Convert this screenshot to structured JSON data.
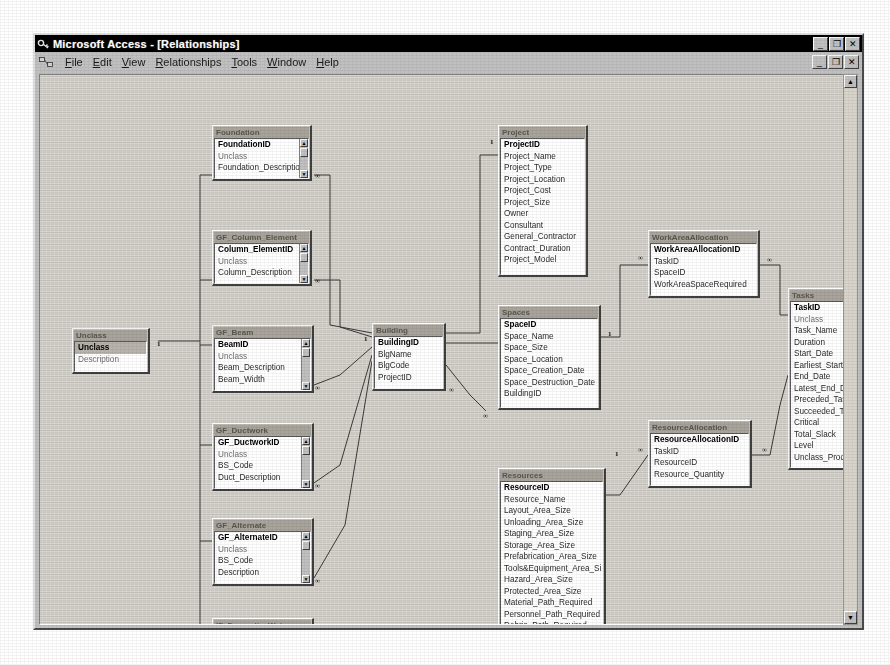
{
  "window": {
    "title": "Microsoft Access - [Relationships]",
    "app_icon": "access-key-icon",
    "buttons": {
      "minimize": "_",
      "restore": "❐",
      "close": "✕"
    },
    "mdi_buttons": {
      "minimize": "_",
      "restore": "❐",
      "close": "✕"
    }
  },
  "menubar": {
    "icon": "relationships-toolbar-icon",
    "items": [
      {
        "label": "File",
        "mnemonic": "F"
      },
      {
        "label": "Edit",
        "mnemonic": "E"
      },
      {
        "label": "View",
        "mnemonic": "V"
      },
      {
        "label": "Relationships",
        "mnemonic": "R"
      },
      {
        "label": "Tools",
        "mnemonic": "T"
      },
      {
        "label": "Window",
        "mnemonic": "W"
      },
      {
        "label": "Help",
        "mnemonic": "H"
      }
    ]
  },
  "scrollbar": {
    "up": "▲",
    "down": "▼"
  },
  "tables": [
    {
      "id": "foundation",
      "caption": "Foundation",
      "x": 172,
      "y": 50,
      "w": 100,
      "h": 56,
      "has_scroll": true,
      "fields": [
        {
          "name": "FoundationID",
          "pk": true
        },
        {
          "name": "Unclass",
          "dim": true
        },
        {
          "name": "Foundation_Description"
        }
      ]
    },
    {
      "id": "gf_column_element",
      "caption": "GF_Column_Element",
      "x": 172,
      "y": 155,
      "w": 100,
      "h": 56,
      "has_scroll": true,
      "fields": [
        {
          "name": "Column_ElementID",
          "pk": true
        },
        {
          "name": "Unclass",
          "dim": true
        },
        {
          "name": "Column_Description"
        }
      ]
    },
    {
      "id": "unclass",
      "caption": "Unclass",
      "x": 32,
      "y": 253,
      "w": 78,
      "h": 46,
      "has_scroll": false,
      "fields": [
        {
          "name": "Unclass",
          "pk": true,
          "selected": true
        },
        {
          "name": "Description",
          "dim": true
        }
      ]
    },
    {
      "id": "gf_beam",
      "caption": "GF_Beam",
      "x": 172,
      "y": 250,
      "w": 102,
      "h": 68,
      "has_scroll": true,
      "fields": [
        {
          "name": "BeamID",
          "pk": true
        },
        {
          "name": "Unclass",
          "dim": true
        },
        {
          "name": "Beam_Description"
        },
        {
          "name": "Beam_Width"
        }
      ]
    },
    {
      "id": "gf_ductwork",
      "caption": "GF_Ductwork",
      "x": 172,
      "y": 348,
      "w": 102,
      "h": 68,
      "has_scroll": true,
      "fields": [
        {
          "name": "GF_DuctworkID",
          "pk": true
        },
        {
          "name": "Unclass",
          "dim": true
        },
        {
          "name": "BS_Code"
        },
        {
          "name": "Duct_Description"
        }
      ]
    },
    {
      "id": "gf_alternate",
      "caption": "GF_Alternate",
      "x": 172,
      "y": 443,
      "w": 102,
      "h": 68,
      "has_scroll": true,
      "fields": [
        {
          "name": "GF_AlternateID",
          "pk": true
        },
        {
          "name": "Unclass",
          "dim": true
        },
        {
          "name": "BS_Code"
        },
        {
          "name": "Description"
        }
      ]
    },
    {
      "id": "if_domestic_water",
      "caption": "IF_Domestic_Water",
      "x": 172,
      "y": 543,
      "w": 102,
      "h": 60,
      "has_scroll": true,
      "fields": [
        {
          "name": "IF_Domestic_WaterID",
          "pk": true
        },
        {
          "name": "Unclass",
          "dim": true
        }
      ]
    },
    {
      "id": "building",
      "caption": "Building",
      "x": 332,
      "y": 248,
      "w": 74,
      "h": 68,
      "has_scroll": false,
      "fields": [
        {
          "name": "BuildingID",
          "pk": true
        },
        {
          "name": "BlgName"
        },
        {
          "name": "BlgCode"
        },
        {
          "name": "ProjectID"
        }
      ]
    },
    {
      "id": "project",
      "caption": "Project",
      "x": 458,
      "y": 50,
      "w": 90,
      "h": 152,
      "has_scroll": false,
      "fields": [
        {
          "name": "ProjectID",
          "pk": true
        },
        {
          "name": "Project_Name"
        },
        {
          "name": "Project_Type"
        },
        {
          "name": "Project_Location"
        },
        {
          "name": "Project_Cost"
        },
        {
          "name": "Project_Size"
        },
        {
          "name": "Owner"
        },
        {
          "name": "Consultant"
        },
        {
          "name": "General_Contractor"
        },
        {
          "name": "Contract_Duration"
        },
        {
          "name": "Project_Model"
        }
      ]
    },
    {
      "id": "spaces",
      "caption": "Spaces",
      "x": 458,
      "y": 230,
      "w": 103,
      "h": 105,
      "has_scroll": false,
      "fields": [
        {
          "name": "SpaceID",
          "pk": true
        },
        {
          "name": "Space_Name"
        },
        {
          "name": "Space_Size"
        },
        {
          "name": "Space_Location"
        },
        {
          "name": "Space_Creation_Date"
        },
        {
          "name": "Space_Destruction_Date"
        },
        {
          "name": "BuildingID"
        }
      ]
    },
    {
      "id": "resources",
      "caption": "Resources",
      "x": 458,
      "y": 393,
      "w": 108,
      "h": 172,
      "has_scroll": false,
      "fields": [
        {
          "name": "ResourceID",
          "pk": true
        },
        {
          "name": "Resource_Name"
        },
        {
          "name": "Layout_Area_Size"
        },
        {
          "name": "Unloading_Area_Size"
        },
        {
          "name": "Staging_Area_Size"
        },
        {
          "name": "Storage_Area_Size"
        },
        {
          "name": "Prefabrication_Area_Size"
        },
        {
          "name": "Tools&Equipment_Area_Size"
        },
        {
          "name": "Hazard_Area_Size"
        },
        {
          "name": "Protected_Area_Size"
        },
        {
          "name": "Material_Path_Required"
        },
        {
          "name": "Personnel_Path_Required"
        },
        {
          "name": "Debris_Path_Required"
        }
      ]
    },
    {
      "id": "workareaallocation",
      "caption": "WorkAreaAllocation",
      "x": 608,
      "y": 155,
      "w": 112,
      "h": 68,
      "has_scroll": false,
      "fields": [
        {
          "name": "WorkAreaAllocationID",
          "pk": true
        },
        {
          "name": "TaskID"
        },
        {
          "name": "SpaceID"
        },
        {
          "name": "WorkAreaSpaceRequired"
        }
      ]
    },
    {
      "id": "resourceallocation",
      "caption": "ResourceAllocation",
      "x": 608,
      "y": 345,
      "w": 104,
      "h": 68,
      "has_scroll": false,
      "fields": [
        {
          "name": "ResourceAllocationID",
          "pk": true
        },
        {
          "name": "TaskID"
        },
        {
          "name": "ResourceID"
        },
        {
          "name": "Resource_Quantity"
        }
      ]
    },
    {
      "id": "tasks",
      "caption": "Tasks",
      "x": 748,
      "y": 213,
      "w": 78,
      "h": 182,
      "has_scroll": false,
      "fields": [
        {
          "name": "TaskID",
          "pk": true
        },
        {
          "name": "Unclass",
          "dim": true
        },
        {
          "name": "Task_Name"
        },
        {
          "name": "Duration"
        },
        {
          "name": "Start_Date"
        },
        {
          "name": "Earliest_Start_Date"
        },
        {
          "name": "End_Date"
        },
        {
          "name": "Latest_End_Date"
        },
        {
          "name": "Preceded_Task"
        },
        {
          "name": "Succeeded_Task"
        },
        {
          "name": "Critical"
        },
        {
          "name": "Total_Slack"
        },
        {
          "name": "Level"
        },
        {
          "name": "Unclass_Product"
        }
      ]
    }
  ],
  "cardinality_markers": [
    {
      "symbol": "∞",
      "x": 275,
      "y": 98
    },
    {
      "symbol": "∞",
      "x": 275,
      "y": 203
    },
    {
      "symbol": "∞",
      "x": 275,
      "y": 310
    },
    {
      "symbol": "∞",
      "x": 275,
      "y": 408
    },
    {
      "symbol": "∞",
      "x": 275,
      "y": 503
    },
    {
      "symbol": "1",
      "x": 117,
      "y": 266
    },
    {
      "symbol": "1",
      "x": 324,
      "y": 261
    },
    {
      "symbol": "∞",
      "x": 409,
      "y": 312
    },
    {
      "symbol": "∞",
      "x": 443,
      "y": 338
    },
    {
      "symbol": "1",
      "x": 450,
      "y": 64
    },
    {
      "symbol": "1",
      "x": 568,
      "y": 256
    },
    {
      "symbol": "∞",
      "x": 598,
      "y": 180
    },
    {
      "symbol": "∞",
      "x": 727,
      "y": 182
    },
    {
      "symbol": "1",
      "x": 575,
      "y": 376
    },
    {
      "symbol": "∞",
      "x": 598,
      "y": 372
    },
    {
      "symbol": "∞",
      "x": 722,
      "y": 372
    }
  ],
  "relationship_lines": [
    "M118,266 L160,266",
    "M160,100 L160,560",
    "M160,100 L172,100",
    "M160,205 L172,205",
    "M160,270 L172,270",
    "M160,370 L172,370",
    "M160,466 L172,466",
    "M160,560 L172,560",
    "M274,100 L290,100 L290,250 L332,258",
    "M274,205 L300,205 L300,252 L332,262",
    "M274,310 L300,300 L332,272",
    "M274,408 L300,390 L332,280",
    "M274,503 L305,450 L332,286",
    "M406,258 L440,258 L440,80 L458,80",
    "M406,268 L430,268 L458,268",
    "M406,290 L430,320 L446,336",
    "M561,262 L580,262 L580,190 L608,190",
    "M720,190 L740,190 L740,240 L748,240",
    "M566,420 L580,420 L608,380",
    "M712,380 L730,380 L740,330 L748,300"
  ]
}
